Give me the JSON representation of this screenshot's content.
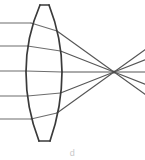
{
  "figure": {
    "caption_partial": "d",
    "background_color": "#ffffff",
    "ray_color": "#6d6d6d",
    "lens_outline_color": "#3a3a3a",
    "focal_point_color": "#4a4a4a"
  },
  "chart_data": {
    "type": "diagram",
    "subtitle": "",
    "xlabel": "",
    "ylabel": "",
    "xlim": [
      0,
      145
    ],
    "ylim": [
      0,
      160
    ],
    "grid": false,
    "legend": "none",
    "optical_axis_y": 72,
    "focal_point": {
      "x": 114,
      "y": 72
    },
    "lens": {
      "shape": "biconvex",
      "center_x": 44,
      "left_vertex_x": 26,
      "right_vertex_x": 62,
      "top_y": 5,
      "bottom_y": 145,
      "apex_top_flat": true,
      "apex_bottom_flat": true,
      "thickness_at_axis": 36
    },
    "rays": [
      {
        "name": "ray-1",
        "incoming_y": 23,
        "entry_x": 31,
        "exit_x": 57,
        "entry_y": 23,
        "exit_y": 31,
        "terminal_x": 145,
        "terminal_y": 41
      },
      {
        "name": "ray-2",
        "incoming_y": 46,
        "entry_x": 27.5,
        "exit_x": 60.5,
        "entry_y": 46,
        "exit_y": 51,
        "terminal_x": 145,
        "terminal_y": 55
      },
      {
        "name": "ray-3",
        "incoming_y": 71,
        "entry_x": 26,
        "exit_x": 62,
        "entry_y": 71,
        "exit_y": 72,
        "terminal_x": 145,
        "terminal_y": 72
      },
      {
        "name": "ray-4",
        "incoming_y": 96,
        "entry_x": 27.5,
        "exit_x": 60.5,
        "entry_y": 96,
        "exit_y": 93,
        "terminal_x": 145,
        "terminal_y": 90
      },
      {
        "name": "ray-5",
        "incoming_y": 119,
        "entry_x": 31,
        "exit_x": 57,
        "entry_y": 119,
        "exit_y": 113,
        "terminal_x": 145,
        "terminal_y": 104
      }
    ],
    "ray_count": 5
  }
}
